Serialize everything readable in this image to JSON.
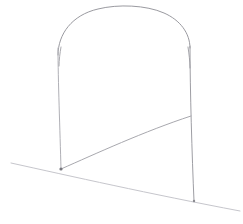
{
  "document": {
    "title": "Line sketch",
    "subject": "arched frame gate structure on sloping ground",
    "medium": "pencil line drawing",
    "background_color": "#ffffff",
    "width": 243,
    "height": 224
  },
  "palette": {
    "paper": "#ffffff",
    "line_dark": "#8a8a90",
    "line_mid": "#a8a8ae",
    "line_light": "#c2c2c8",
    "line_faint": "#d6d6da",
    "node_dark": "#77777e"
  },
  "drawing": {
    "type": "line-sketch",
    "stroke_count": 7,
    "strokes": [
      {
        "id": "arch-top",
        "name": "arch-curve",
        "role": "upper rounded arch spanning between the two posts",
        "color": "#9a9aa0",
        "width": 1.0,
        "path": "M 58 55 C 58 34, 72 15, 98 9 C 118 4, 146 5, 164 13 C 180 20, 190 33, 190 48"
      },
      {
        "id": "post-left",
        "name": "left-vertical-post",
        "role": "left upright of the frame",
        "color": "#b0b0b6",
        "width": 1.0,
        "path": "M 58 48 C 58 80, 60 130, 61 169"
      },
      {
        "id": "post-right",
        "name": "right-vertical-post",
        "role": "right upright of the frame",
        "color": "#9e9ea4",
        "width": 1.0,
        "path": "M 190 46 C 190 90, 192 155, 194 201"
      },
      {
        "id": "brace-diagonal",
        "name": "diagonal-brace",
        "role": "curved diagonal running from left post base up to right post",
        "color": "#a8a8ae",
        "width": 1.0,
        "path": "M 61 169 C 95 154, 145 131, 191 116"
      },
      {
        "id": "ground-line",
        "name": "ground-line",
        "role": "sloping horizon / ground line crossing the whole image",
        "color": "#c6c6cc",
        "width": 1.0,
        "path": "M 11 163 C 70 176, 150 194, 240 211"
      },
      {
        "id": "post-left-kink",
        "name": "left-post-shoulder-kink",
        "role": "short doubled stroke where arch meets left post",
        "color": "#a0a0a6",
        "width": 0.9,
        "path": "M 61 47 C 60 53, 59 60, 59 66"
      },
      {
        "id": "post-right-kink",
        "name": "right-post-shoulder-kink",
        "role": "short doubled stroke where arch meets right post",
        "color": "#9a9aa0",
        "width": 0.9,
        "path": "M 188 47 C 189 54, 190 61, 190 68"
      }
    ],
    "nodes": [
      {
        "id": "node-left-base",
        "name": "left-post-ground-contact",
        "x": 61,
        "y": 169,
        "radius": 1.6,
        "color": "#77777e"
      },
      {
        "id": "node-right-base",
        "name": "right-post-ground-contact",
        "x": 194,
        "y": 201,
        "radius": 1.2,
        "color": "#8a8a90"
      }
    ]
  }
}
